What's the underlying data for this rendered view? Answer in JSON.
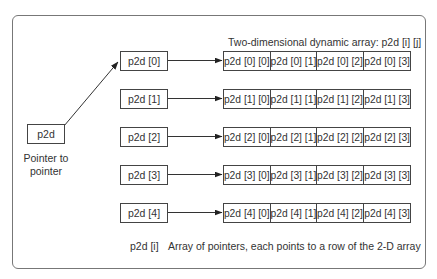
{
  "diagram": {
    "title": "Two-dimensional dynamic array: p2d [i] [j]",
    "pointer": {
      "label": "p2d",
      "caption_line1": "Pointer to",
      "caption_line2": "pointer"
    },
    "row_pointers": [
      {
        "label": "p2d [0]"
      },
      {
        "label": "p2d [1]"
      },
      {
        "label": "p2d [2]"
      },
      {
        "label": "p2d [3]"
      },
      {
        "label": "p2d [4]"
      }
    ],
    "rows": [
      [
        "p2d [0] [0]",
        "p2d [0] [1]",
        "p2d [0] [2]",
        "p2d [0] [3]"
      ],
      [
        "p2d [1] [0]",
        "p2d [1] [1]",
        "p2d [1] [2]",
        "p2d [1] [3]"
      ],
      [
        "p2d [2] [0]",
        "p2d [2] [1]",
        "p2d [2] [2]",
        "p2d [2] [3]"
      ],
      [
        "p2d [3] [0]",
        "p2d [3] [1]",
        "p2d [3] [2]",
        "p2d [3] [3]"
      ],
      [
        "p2d [4] [0]",
        "p2d [4] [1]",
        "p2d [4] [2]",
        "p2d [4] [3]"
      ]
    ],
    "legend": {
      "key": "p2d [i]",
      "description": "Array of pointers, each points to a row of the 2-D array"
    },
    "colors": {
      "stroke": "#444444",
      "frame": "#777777",
      "text": "#333333"
    }
  }
}
